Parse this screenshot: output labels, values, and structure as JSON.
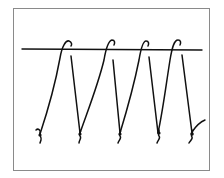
{
  "diagram": {
    "type": "hand-drawn stitch diagram",
    "stroke_color": "#111111",
    "frame_color": "#8a8a8a",
    "background_color": "#ffffff",
    "horizontal_line": {
      "x1": 22,
      "y1": 49,
      "x2": 202,
      "y2": 50
    },
    "loops": [
      {
        "rise_from": [
          40,
          134
        ],
        "hook_top": [
          68,
          41
        ],
        "descend_from": [
          71,
          56
        ],
        "descend_to": [
          80,
          133
        ]
      },
      {
        "rise_from": [
          80,
          133
        ],
        "hook_top": [
          111,
          40
        ],
        "descend_from": [
          113,
          60
        ],
        "descend_to": [
          120,
          133
        ]
      },
      {
        "rise_from": [
          120,
          133
        ],
        "hook_top": [
          145,
          41
        ],
        "descend_from": [
          149,
          57
        ],
        "descend_to": [
          158,
          133
        ]
      },
      {
        "rise_from": [
          158,
          133
        ],
        "hook_top": [
          177,
          40
        ],
        "descend_from": [
          182,
          55
        ],
        "descend_to": [
          192,
          133
        ]
      }
    ],
    "knots": [
      {
        "x": 40,
        "y": 134
      },
      {
        "x": 80,
        "y": 134
      },
      {
        "x": 120,
        "y": 134
      },
      {
        "x": 158,
        "y": 134
      },
      {
        "x": 192,
        "y": 134
      }
    ],
    "end_tail": {
      "from": [
        192,
        132
      ],
      "to": [
        205,
        120
      ]
    }
  }
}
